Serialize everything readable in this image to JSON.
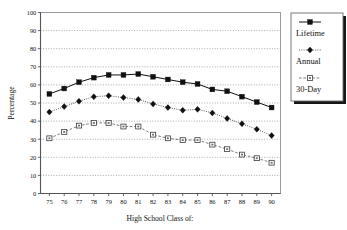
{
  "chart_data": {
    "type": "line",
    "title": "",
    "xlabel": "High School Class of:",
    "ylabel": "Percentage",
    "categories": [
      "75",
      "76",
      "77",
      "78",
      "79",
      "80",
      "81",
      "82",
      "83",
      "84",
      "85",
      "86",
      "87",
      "88",
      "89",
      "90"
    ],
    "x": [
      75,
      76,
      77,
      78,
      79,
      80,
      81,
      82,
      83,
      84,
      85,
      86,
      87,
      88,
      89,
      90
    ],
    "xlim": [
      74.4,
      90.6
    ],
    "ylim": [
      0,
      100
    ],
    "ytick_labels": [
      "0",
      "10",
      "20",
      "30",
      "40",
      "50",
      "60",
      "70",
      "80",
      "90",
      "100"
    ],
    "yticks": [
      0,
      10,
      20,
      30,
      40,
      50,
      60,
      70,
      80,
      90,
      100
    ],
    "grid": "horizontal-dotted",
    "legend_position": "right-outside",
    "series": [
      {
        "name": "Lifetime",
        "marker": "filled-square",
        "linestyle": "solid",
        "color": "#101010",
        "values": [
          55,
          58,
          61.5,
          64,
          65.5,
          65.5,
          66,
          64.5,
          63,
          61.5,
          60.5,
          57.5,
          56.5,
          53.5,
          50.5,
          47.5
        ]
      },
      {
        "name": "Annual",
        "marker": "filled-diamond",
        "linestyle": "dotted",
        "color": "#101010",
        "values": [
          45,
          48,
          51,
          53.5,
          54,
          53,
          52,
          49.5,
          47.5,
          46,
          46.5,
          44.5,
          41.5,
          38.5,
          35.5,
          32
        ]
      },
      {
        "name": "30-Day",
        "marker": "open-square",
        "linestyle": "dashed",
        "color": "#444444",
        "values": [
          30.5,
          34,
          37.5,
          39,
          39,
          37,
          37,
          32.5,
          30.5,
          29.5,
          29.5,
          27,
          24.5,
          21.5,
          19.5,
          17
        ]
      }
    ]
  },
  "legend": {
    "items": [
      {
        "label": "Lifetime",
        "marker": "filled-square",
        "linestyle": "solid"
      },
      {
        "label": "Annual",
        "marker": "filled-diamond",
        "linestyle": "dotted"
      },
      {
        "label": "30-Day",
        "marker": "open-square",
        "linestyle": "dashed"
      }
    ]
  },
  "colors": {
    "background": "#ffffff",
    "axis": "#555555",
    "grid": "#555555",
    "frame": "#9a9a9a",
    "series_primary": "#101010",
    "series_tertiary": "#444444",
    "legend_shadow": "#171717"
  }
}
